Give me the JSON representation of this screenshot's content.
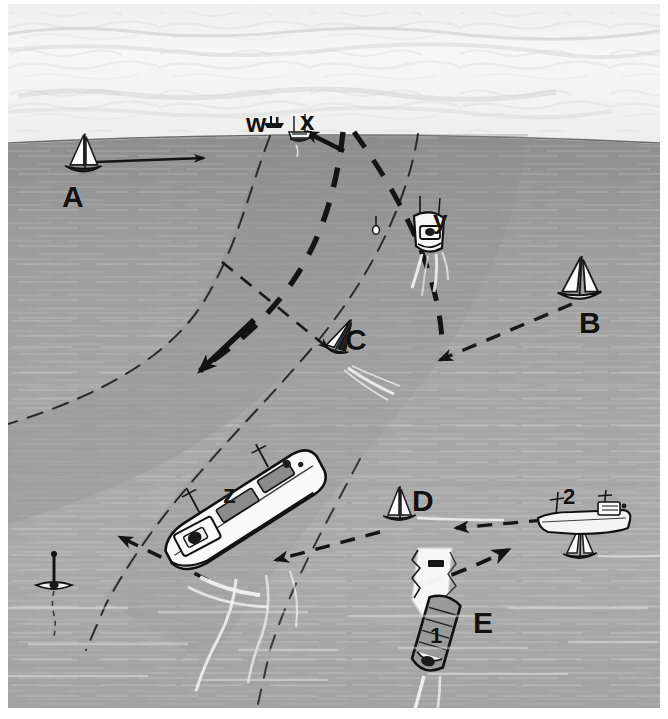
{
  "scene": {
    "title": "Shipping channel with traffic separation scheme",
    "width": 668,
    "height": 719,
    "horizon_y": 135,
    "colors": {
      "sky": "#f2f2f2",
      "sea_light": "#a8a8a8",
      "sea_mid": "#9b9b9b",
      "channel_fill": "#8f8f8f",
      "ink": "#141414",
      "hull_dark": "#1d1d1d",
      "sail_white": "#fdfdfd",
      "wake_white": "#f5f5f5",
      "page_border": "#ffffff"
    }
  },
  "labels": [
    {
      "id": "A",
      "text": "A",
      "x": 62,
      "y": 180,
      "size": "big",
      "note": "sailboat crossing to the right, solid arrow"
    },
    {
      "id": "B",
      "text": "B",
      "x": 578,
      "y": 308,
      "size": "big",
      "note": "sailboat right of channel, dashed arrow into channel"
    },
    {
      "id": "C",
      "text": "C",
      "x": 344,
      "y": 325,
      "size": "big",
      "note": "heeling sailboat inside channel with wake"
    },
    {
      "id": "D",
      "text": "D",
      "x": 412,
      "y": 486,
      "size": "big",
      "note": "sailboat near channel edge, lower middle"
    },
    {
      "id": "E",
      "text": "E",
      "x": 473,
      "y": 609,
      "size": "big",
      "note": "open water label lower right"
    },
    {
      "id": "W",
      "text": "w",
      "x": 245,
      "y": 112,
      "size": "mid",
      "note": "distant vessel on the horizon, left of X"
    },
    {
      "id": "X",
      "text": "x",
      "x": 299,
      "y": 111,
      "size": "mid",
      "note": "fishing boat on the horizon in channel"
    },
    {
      "id": "Y",
      "text": "y",
      "x": 432,
      "y": 210,
      "size": "mid",
      "note": "motor boat making way, wake astern"
    },
    {
      "id": "Z",
      "text": "z",
      "x": 222,
      "y": 482,
      "size": "mid",
      "note": "large cargo ship steaming down channel"
    },
    {
      "id": "1",
      "text": "1",
      "x": 428,
      "y": 627,
      "size": "sm",
      "note": "bulk carrier lower centre with dashed turn arrow"
    },
    {
      "id": "2",
      "text": "2",
      "x": 562,
      "y": 487,
      "size": "sm",
      "note": "small freighter on the right with dashed arrow left"
    }
  ],
  "vessels": [
    {
      "name": "sailboat-a",
      "label": "A",
      "type": "sailboat",
      "heading": "east"
    },
    {
      "name": "sailboat-b",
      "label": "B",
      "type": "sailboat",
      "heading": "west-southwest"
    },
    {
      "name": "sailboat-c",
      "label": "C",
      "type": "sailboat",
      "heading": "northeast-heeling"
    },
    {
      "name": "sailboat-d",
      "label": "D",
      "type": "sailboat",
      "heading": "west"
    },
    {
      "name": "freighter-w",
      "label": "w",
      "type": "freighter",
      "heading": "horizon"
    },
    {
      "name": "fishing-boat-x",
      "label": "x",
      "type": "fishing-boat",
      "heading": "toward-viewer"
    },
    {
      "name": "motorboat-y",
      "label": "y",
      "type": "motorboat",
      "heading": "toward-viewer"
    },
    {
      "name": "cargo-ship-z",
      "label": "z",
      "type": "cargo-ship",
      "heading": "south-southwest"
    },
    {
      "name": "bulk-carrier-1",
      "label": "1",
      "type": "cargo-ship",
      "heading": "toward-viewer"
    },
    {
      "name": "freighter-2",
      "label": "2",
      "type": "freighter",
      "heading": "west"
    },
    {
      "name": "sailboat-extra-right",
      "label": "",
      "type": "sailboat",
      "heading": "west"
    },
    {
      "name": "buoy-left",
      "label": "",
      "type": "buoy",
      "heading": "moored"
    },
    {
      "name": "buoy-upper",
      "label": "",
      "type": "buoy",
      "heading": "moored"
    }
  ],
  "channel": {
    "name": "dredged-channel",
    "edge_style": "thin-dashed",
    "centerline_style": "thick-dashed",
    "description": "S-curved channel running from the horizon down to the lower left"
  },
  "arrows": [
    {
      "name": "arrow-a",
      "style": "solid",
      "from": "A",
      "direction": "east"
    },
    {
      "name": "arrow-b",
      "style": "dashed",
      "from": "B",
      "direction": "west-southwest"
    },
    {
      "name": "arrow-c",
      "style": "dashed",
      "from": "centreline",
      "direction": "northeast"
    },
    {
      "name": "arrow-centreline-down",
      "style": "thick-dashed",
      "from": "centreline",
      "direction": "southwest"
    },
    {
      "name": "arrow-centreline-up",
      "style": "thick-dashed",
      "from": "centreline",
      "direction": "northeast"
    },
    {
      "name": "arrow-z",
      "style": "dashed",
      "from": "z",
      "direction": "west-northwest"
    },
    {
      "name": "arrow-d",
      "style": "dashed",
      "from": "D",
      "direction": "west"
    },
    {
      "name": "arrow-2",
      "style": "dashed",
      "from": "2",
      "direction": "west"
    },
    {
      "name": "arrow-1",
      "style": "dashed",
      "from": "1",
      "direction": "east-northeast"
    }
  ]
}
